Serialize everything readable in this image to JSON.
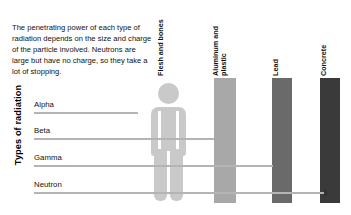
{
  "intro": {
    "text": "The penetrating power of each type of radiation depends on the size and charge of the particle involved. Neutrons are large but have no charge, so they take a lot of stopping."
  },
  "axis": {
    "y_title": "Types of radiation"
  },
  "barriers": [
    {
      "id": "flesh",
      "label": "Flesh and bones",
      "color": "#c9c9c9",
      "icon": "person-icon"
    },
    {
      "id": "aluminum",
      "label": "Aluminum and\nplastic",
      "color": "#a8a8a8"
    },
    {
      "id": "lead",
      "label": "Lead",
      "color": "#6a6a6a"
    },
    {
      "id": "concrete",
      "label": "Concrete",
      "color": "#3a3a3a"
    }
  ],
  "rows": [
    {
      "name": "Alpha",
      "stopped_by": "Flesh and bones",
      "ray_color": "#b4b4b4"
    },
    {
      "name": "Beta",
      "stopped_by": "Aluminum and plastic",
      "ray_color": "#b4b4b4"
    },
    {
      "name": "Gamma",
      "stopped_by": "Lead",
      "ray_color": "#b4b4b4"
    },
    {
      "name": "Neutron",
      "stopped_by": "Concrete",
      "ray_color": "#b4b4b4"
    }
  ],
  "chart_data": {
    "type": "bar",
    "xlabel": "Shielding material penetrated",
    "ylabel": "Types of radiation",
    "categories": [
      "Alpha",
      "Beta",
      "Gamma",
      "Neutron"
    ],
    "barrier_levels": [
      "Flesh and bones",
      "Aluminum and plastic",
      "Lead",
      "Concrete"
    ],
    "values": [
      1,
      2,
      3,
      4
    ],
    "value_labels": [
      "Flesh and bones",
      "Aluminum and plastic",
      "Lead",
      "Concrete"
    ],
    "xlim": [
      0,
      4
    ],
    "grid": false,
    "legend": "none",
    "orientation": "horizontal",
    "annotation": "Arrow length shows how far each radiation type penetrates before being stopped."
  }
}
